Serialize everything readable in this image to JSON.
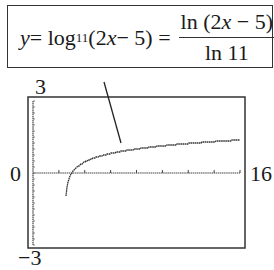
{
  "formula": {
    "lhs": "y",
    "eq1": " = log",
    "base": "11",
    "arg": " (2",
    "x1": "x",
    "arg_tail": " − 5) =",
    "num_pre": "ln (2",
    "num_x": "x",
    "num_post": " − 5)",
    "den": "ln 11"
  },
  "axis_labels": {
    "ymax": "3",
    "ymin": "−3",
    "xmin": "0",
    "xmax": "16"
  },
  "chart_data": {
    "type": "line",
    "xlabel": "",
    "ylabel": "",
    "xlim": [
      0,
      16
    ],
    "ylim": [
      -3,
      3
    ],
    "x_ticks_every": 2,
    "y_ticks_every": 0.25,
    "grid": false,
    "series": [
      {
        "name": "y = ln(2x-5)/ln 11",
        "x": [
          2.55,
          2.6,
          2.75,
          3.0,
          3.5,
          4,
          5,
          6,
          7,
          8,
          9,
          10,
          12,
          14,
          16
        ],
        "y": [
          -2.3,
          -1.5,
          -0.29,
          0,
          0.46,
          0.67,
          0.93,
          1.09,
          1.21,
          1.3,
          1.38,
          1.45,
          1.56,
          1.65,
          1.73
        ]
      }
    ],
    "annotations": [
      "Callout box with formula pointing to curve"
    ]
  }
}
